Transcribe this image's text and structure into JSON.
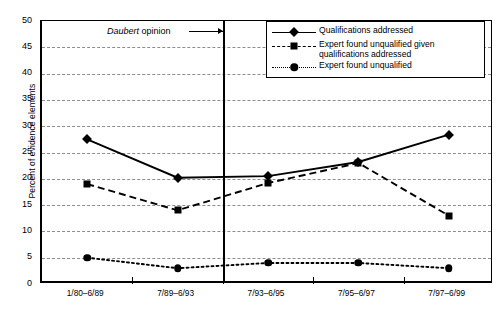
{
  "chart_data": {
    "type": "line",
    "title": "",
    "xlabel": "",
    "ylabel": "Percent of evidence elements",
    "categories": [
      "1/80–6/89",
      "7/89–6/93",
      "7/93–6/95",
      "7/95–6/97",
      "7/97–6/99"
    ],
    "ylim": [
      0,
      50
    ],
    "yticks": [
      0,
      5,
      10,
      15,
      20,
      25,
      30,
      35,
      40,
      45,
      50
    ],
    "grid": "horizontal-dashed",
    "legend_position": "top-right-inside",
    "series": [
      {
        "name": "Qualifications addressed",
        "marker": "diamond",
        "line_style": "solid",
        "values": [
          27.5,
          20.2,
          20.5,
          23.2,
          28.4
        ]
      },
      {
        "name": "Expert found unqualified given qualifications addressed",
        "marker": "square",
        "line_style": "dashed",
        "values": [
          19.0,
          14.0,
          19.2,
          23.0,
          13.0
        ]
      },
      {
        "name": "Expert found unqualified",
        "marker": "circle",
        "line_style": "dotted",
        "values": [
          5.0,
          3.0,
          4.0,
          4.0,
          3.0
        ]
      }
    ],
    "annotations": [
      {
        "text_italic": "Daubert",
        "text_roman": " opinion",
        "kind": "vertical-divider-callout",
        "divider_between_categories": [
          "7/89–6/93",
          "7/93–6/95"
        ]
      }
    ],
    "colors": {
      "line": "#000000",
      "grid": "#8d8d8d",
      "axis": "#000000",
      "background": "#ffffff"
    }
  },
  "legend": {
    "items": [
      {
        "label": "Qualifications addressed"
      },
      {
        "label_line1": "Expert found unqualified given",
        "label_line2": "qualifications addressed"
      },
      {
        "label": "Expert found unqualified"
      }
    ]
  }
}
